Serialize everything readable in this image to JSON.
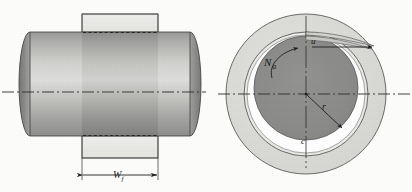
{
  "figure": {
    "background_color": "#fdfdfc",
    "views": [
      {
        "id": "axial",
        "name": "Axial (side) section view of journal in bearing"
      },
      {
        "id": "radial",
        "name": "Radial (end) section view of journal in bearing"
      }
    ]
  },
  "labels": {
    "bearing_width": {
      "symbol": "W",
      "subscript": "f",
      "meaning": "bearing width"
    },
    "surface_velocity": {
      "symbol": "u",
      "subscript": "",
      "meaning": "surface velocity of journal"
    },
    "rotational_speed": {
      "symbol": "N",
      "subscript": "a",
      "meaning": "journal rotational speed"
    },
    "journal_radius": {
      "symbol": "r",
      "subscript": "",
      "meaning": "journal radius"
    },
    "radial_clearance": {
      "symbol": "c",
      "subscript": "",
      "meaning": "radial clearance"
    }
  },
  "colors": {
    "bearing_fill": "#d9d9d6",
    "bearing_fill_light": "#e8e8e5",
    "journal_fill": "#8a8a8a",
    "journal_dark": "#7a7a7a",
    "shaft_light": "#d5d5d2",
    "shaft_mid": "#b4b4b2",
    "shaft_dark": "#8e8e8c",
    "oil_film": "#ffffff",
    "line": "#2a2a2a",
    "centerline": "#3a3a3a",
    "hidden_line": "#3a3a3a"
  },
  "geometry": {
    "axial_view": {
      "bearing_left_x": 82,
      "bearing_right_x": 158,
      "bearing_top_y": 14,
      "bearing_bottom_y": 158,
      "shaft_top_y": 32,
      "shaft_bottom_y": 136,
      "shaft_left_x": 18,
      "shaft_right_x": 198,
      "centerline_y": 92
    },
    "radial_view": {
      "center_x": 306,
      "center_y": 94,
      "bearing_outer_r": 80,
      "bearing_inner_r": 62,
      "oil_film_outer_r": 58,
      "journal_r": 52,
      "journal_offset_y": -6,
      "centerline_y": 94
    }
  }
}
